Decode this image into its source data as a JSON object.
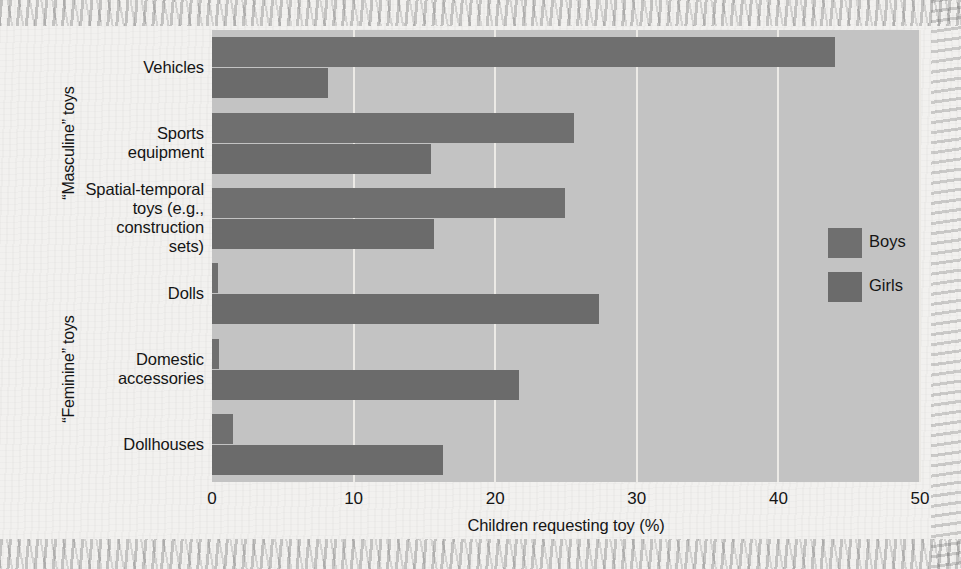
{
  "chart_data": {
    "type": "bar",
    "orientation": "horizontal",
    "title": "",
    "xlabel": "Children requesting toy (%)",
    "ylabel": "",
    "xlim": [
      0,
      50
    ],
    "xticks": [
      0,
      10,
      20,
      30,
      40,
      50
    ],
    "xtick_labels": [
      "0",
      "10",
      "20",
      "30",
      "40",
      "50"
    ],
    "grid": true,
    "grid_axis": "x",
    "legend_position": "right",
    "categories": [
      "Vehicles",
      "Sports equipment",
      "Spatial-temporal toys (e.g., construction sets)",
      "Dolls",
      "Domestic accessories",
      "Dollhouses"
    ],
    "category_lines": [
      [
        "Vehicles"
      ],
      [
        "Sports",
        "equipment"
      ],
      [
        "Spatial-temporal",
        "toys (e.g.,",
        "construction",
        "sets)"
      ],
      [
        "Dolls"
      ],
      [
        "Domestic",
        "accessories"
      ],
      [
        "Dollhouses"
      ]
    ],
    "category_groups": [
      {
        "label": "“Masculine” toys",
        "categories": [
          "Vehicles",
          "Sports equipment",
          "Spatial-temporal toys (e.g., construction sets)"
        ]
      },
      {
        "label": "“Feminine” toys",
        "categories": [
          "Dolls",
          "Domestic accessories",
          "Dollhouses"
        ]
      }
    ],
    "series": [
      {
        "name": "Boys",
        "color": "#6f6f6f",
        "values": [
          44.0,
          25.6,
          24.9,
          0.4,
          0.5,
          1.5
        ]
      },
      {
        "name": "Girls",
        "color": "#6b6b6b",
        "values": [
          8.2,
          15.5,
          15.7,
          27.3,
          21.7,
          16.3
        ]
      }
    ],
    "plot_background": "#c3c3c3",
    "gridline_color": "#eceae6"
  },
  "legend": {
    "entries": [
      {
        "label": "Boys",
        "color": "#6f6f6f"
      },
      {
        "label": "Girls",
        "color": "#6b6b6b"
      }
    ]
  },
  "axis": {
    "x_title": "Children requesting toy (%)",
    "tick_labels": [
      "0",
      "10",
      "20",
      "30",
      "40",
      "50"
    ]
  },
  "groups": {
    "masculine": "“Masculine” toys",
    "feminine": "“Feminine” toys"
  }
}
